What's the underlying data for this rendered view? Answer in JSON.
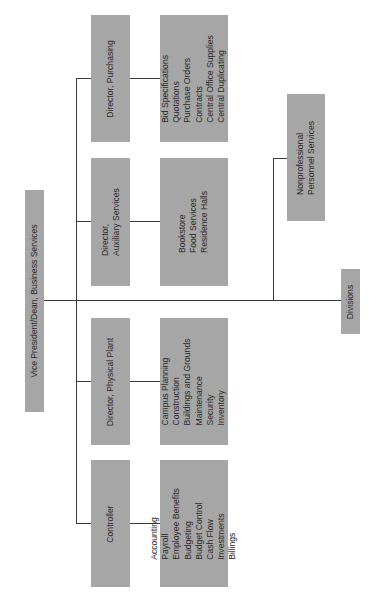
{
  "chart_title": "",
  "root": {
    "label": "Vice President/Dean, Business Services"
  },
  "directors": [
    {
      "title_lines": [
        "Director, Purchasing"
      ],
      "functions": [
        "Bid Specifications",
        "Quotations",
        "Purchase Orders",
        "Contracts",
        "Central Office Supplies",
        "Central Duplicating"
      ]
    },
    {
      "title_lines": [
        "Director,",
        "Auxiliary Services"
      ],
      "functions": [
        "Bookstore",
        "Food Services",
        "Residence Halls"
      ]
    },
    {
      "title_lines": [
        "Director, Physical Plant"
      ],
      "functions": [
        "Campus Planning",
        "Construction",
        "Buildings and Grounds",
        "Maintenance",
        "Security",
        "Inventory"
      ]
    },
    {
      "title_lines": [
        "Controller"
      ],
      "functions": [
        "Accounting",
        "Payroll",
        "Employee Benefits",
        "Budgeting",
        "Budget Control",
        "Cash Flow",
        "Investments",
        "Billings"
      ]
    }
  ],
  "staff": {
    "title_lines": [
      "Nonprofessional",
      "Personnel Services"
    ]
  },
  "divisions": {
    "label": "Divisions"
  },
  "colors": {
    "box_fill": "#a6a6a6",
    "line": "#3a3a3a",
    "text": "#2a2a2a",
    "background": "#ffffff"
  }
}
